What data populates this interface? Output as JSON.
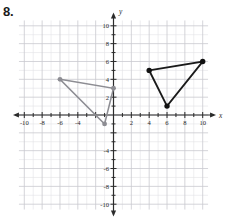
{
  "problem": {
    "number": "8."
  },
  "axes": {
    "x_label": "x",
    "y_label": "y",
    "x_tick_labels": [
      "-10",
      "-8",
      "-6",
      "-4",
      "2",
      "4",
      "6",
      "8",
      "10"
    ],
    "y_tick_labels": [
      "10",
      "8",
      "6",
      "4",
      "-2",
      "-4",
      "-6",
      "-8",
      "-10"
    ],
    "x_range": [
      -11,
      11
    ],
    "y_range": [
      -11,
      11
    ],
    "grid": "on",
    "grid_step": 1,
    "major_grid_step": 2
  },
  "chart_data": {
    "type": "scatter",
    "title": "",
    "xlabel": "x",
    "ylabel": "y",
    "xlim": [
      -11,
      11
    ],
    "ylim": [
      -11,
      11
    ],
    "grid": true,
    "legend": "none",
    "xticks": [
      -10,
      -8,
      -6,
      -4,
      -2,
      2,
      4,
      6,
      8,
      10
    ],
    "yticks": [
      -10,
      -8,
      -6,
      -4,
      -2,
      2,
      4,
      6,
      8,
      10
    ],
    "xtick_labels": [
      "-10",
      "-8",
      "-6",
      "-4",
      "",
      "2",
      "4",
      "6",
      "8",
      "10"
    ],
    "ytick_labels": [
      "-10",
      "-8",
      "-6",
      "-4",
      "",
      "2",
      "4",
      "6",
      "8",
      "10"
    ],
    "series": [
      {
        "name": "preimage-triangle",
        "shape": "triangle",
        "color": "#8d8d93",
        "closed": true,
        "x": [
          -6,
          0,
          -1
        ],
        "y": [
          4,
          3,
          -1
        ],
        "vertices": [
          [
            -6,
            4
          ],
          [
            0,
            3
          ],
          [
            -1,
            -1
          ]
        ]
      },
      {
        "name": "image-triangle",
        "shape": "triangle",
        "color": "#1a1a1a",
        "closed": true,
        "x": [
          4,
          10,
          6
        ],
        "y": [
          5,
          6,
          1
        ],
        "vertices": [
          [
            4,
            5
          ],
          [
            10,
            6
          ],
          [
            6,
            1
          ]
        ]
      }
    ]
  }
}
